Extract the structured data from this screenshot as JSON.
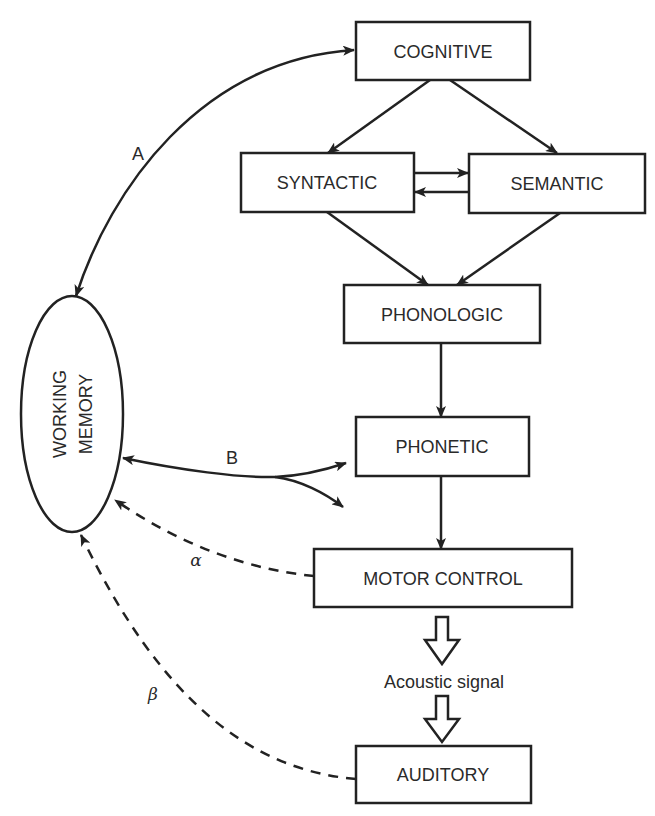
{
  "diagram": {
    "type": "speech production model with working memory",
    "nodes": {
      "cognitive": "COGNITIVE",
      "syntactic": "SYNTACTIC",
      "semantic": "SEMANTIC",
      "phonologic": "PHONOLOGIC",
      "phonetic": "PHONETIC",
      "motor_control": "MOTOR CONTROL",
      "auditory": "AUDITORY",
      "working_memory_line1": "WORKING",
      "working_memory_line2": "MEMORY"
    },
    "labels": {
      "link_a": "A",
      "link_b": "B",
      "link_alpha": "α",
      "link_beta": "β",
      "acoustic_signal": "Acoustic signal"
    },
    "edges": [
      {
        "from": "COGNITIVE",
        "to": "SYNTACTIC",
        "style": "solid"
      },
      {
        "from": "COGNITIVE",
        "to": "SEMANTIC",
        "style": "solid"
      },
      {
        "from": "SYNTACTIC",
        "to": "SEMANTIC",
        "style": "solid"
      },
      {
        "from": "SEMANTIC",
        "to": "SYNTACTIC",
        "style": "solid"
      },
      {
        "from": "SYNTACTIC",
        "to": "PHONOLOGIC",
        "style": "solid"
      },
      {
        "from": "SEMANTIC",
        "to": "PHONOLOGIC",
        "style": "solid"
      },
      {
        "from": "PHONOLOGIC",
        "to": "PHONETIC",
        "style": "solid"
      },
      {
        "from": "PHONETIC",
        "to": "MOTOR CONTROL",
        "style": "solid"
      },
      {
        "from": "MOTOR CONTROL",
        "to": "AUDITORY",
        "style": "hollow",
        "via": "Acoustic signal"
      },
      {
        "from": "WORKING MEMORY",
        "to": "COGNITIVE",
        "style": "solid-bidirectional",
        "label": "A"
      },
      {
        "from": "WORKING MEMORY",
        "to": "PHONETIC",
        "style": "solid-bidirectional-forked",
        "label": "B"
      },
      {
        "from": "MOTOR CONTROL",
        "to": "WORKING MEMORY",
        "style": "dashed",
        "label": "α"
      },
      {
        "from": "AUDITORY",
        "to": "WORKING MEMORY",
        "style": "dashed",
        "label": "β"
      }
    ],
    "colors": {
      "stroke": "#222222",
      "background": "#ffffff"
    }
  }
}
